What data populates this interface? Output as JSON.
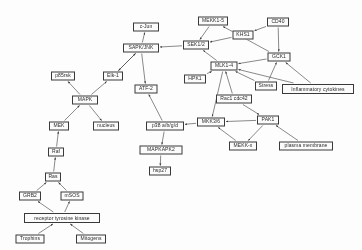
{
  "diagram": {
    "stroke_color": "#3a3a3a",
    "node_fill": "#fbfbfb",
    "background": "#fdfdfd",
    "nodes": [
      {
        "id": "c-jun",
        "label": "c-Jun",
        "x": 146,
        "y": 27,
        "w": 26,
        "h": 9
      },
      {
        "id": "mekk1-5",
        "label": "MEKK1-5",
        "x": 213,
        "y": 21,
        "w": 30,
        "h": 9
      },
      {
        "id": "cd40",
        "label": "CD40",
        "x": 278,
        "y": 22,
        "w": 22,
        "h": 9
      },
      {
        "id": "sapk-jnk",
        "label": "SAPK/JNK",
        "x": 141,
        "y": 48,
        "w": 36,
        "h": 9
      },
      {
        "id": "khs1",
        "label": "KHS1",
        "x": 243,
        "y": 35,
        "w": 21,
        "h": 9
      },
      {
        "id": "p85rsk",
        "label": "p85rsk",
        "x": 63,
        "y": 76,
        "w": 24,
        "h": 9
      },
      {
        "id": "elk-1",
        "label": "Elk-1",
        "x": 113,
        "y": 76,
        "w": 20,
        "h": 9
      },
      {
        "id": "sek1-2",
        "label": "SEK1/2",
        "x": 196,
        "y": 45,
        "w": 26,
        "h": 9
      },
      {
        "id": "gck1",
        "label": "GCK1",
        "x": 279,
        "y": 57,
        "w": 23,
        "h": 9
      },
      {
        "id": "mlk1-4",
        "label": "MLK1-4",
        "x": 224,
        "y": 66,
        "w": 27,
        "h": 9
      },
      {
        "id": "atf-2",
        "label": "ATF-2",
        "x": 146,
        "y": 89,
        "w": 23,
        "h": 9
      },
      {
        "id": "mapk",
        "label": "MAPK",
        "x": 85,
        "y": 100,
        "w": 26,
        "h": 9
      },
      {
        "id": "hpk1",
        "label": "HPK1",
        "x": 195,
        "y": 79,
        "w": 22,
        "h": 9
      },
      {
        "id": "stress",
        "label": "Stress",
        "x": 266,
        "y": 86,
        "w": 22,
        "h": 9
      },
      {
        "id": "infl-cyt",
        "label": "Inflammatory cytokines",
        "x": 318,
        "y": 89,
        "w": 72,
        "h": 10
      },
      {
        "id": "rac1-cdc42",
        "label": "Rac1 cdc42",
        "x": 234,
        "y": 99,
        "w": 36,
        "h": 9
      },
      {
        "id": "mek",
        "label": "MEK",
        "x": 59,
        "y": 126,
        "w": 20,
        "h": 9
      },
      {
        "id": "nucleus",
        "label": "nucleus",
        "x": 106,
        "y": 126,
        "w": 26,
        "h": 9
      },
      {
        "id": "p38",
        "label": "p38 a/b/g/d",
        "x": 165,
        "y": 126,
        "w": 38,
        "h": 9
      },
      {
        "id": "mkk3-6",
        "label": "MKK3/6",
        "x": 211,
        "y": 122,
        "w": 28,
        "h": 9
      },
      {
        "id": "pak1",
        "label": "PAK1",
        "x": 268,
        "y": 120,
        "w": 22,
        "h": 9
      },
      {
        "id": "mapkapk2",
        "label": "MAPKAPK2",
        "x": 161,
        "y": 150,
        "w": 43,
        "h": 9
      },
      {
        "id": "mekk-x",
        "label": "MEKK-x",
        "x": 243,
        "y": 146,
        "w": 28,
        "h": 9
      },
      {
        "id": "plasma-mem",
        "label": "plasma membrane",
        "x": 306,
        "y": 146,
        "w": 54,
        "h": 9
      },
      {
        "id": "raf",
        "label": "Raf",
        "x": 56,
        "y": 152,
        "w": 16,
        "h": 9
      },
      {
        "id": "ras",
        "label": "Ras",
        "x": 53,
        "y": 177,
        "w": 16,
        "h": 9
      },
      {
        "id": "hsp27",
        "label": "hsp27",
        "x": 160,
        "y": 171,
        "w": 22,
        "h": 9
      },
      {
        "id": "grb2",
        "label": "GRB2",
        "x": 30,
        "y": 196,
        "w": 22,
        "h": 9
      },
      {
        "id": "msos",
        "label": "mSOS",
        "x": 72,
        "y": 196,
        "w": 23,
        "h": 9
      },
      {
        "id": "rtk",
        "label": "receptor tyrosine kinase",
        "x": 62,
        "y": 218,
        "w": 76,
        "h": 10
      },
      {
        "id": "trophins",
        "label": "Trophins",
        "x": 30,
        "y": 239,
        "w": 29,
        "h": 9
      },
      {
        "id": "mitogens",
        "label": "Mitogens",
        "x": 91,
        "y": 239,
        "w": 30,
        "h": 9
      }
    ],
    "edges": [
      {
        "from": "sapk-jnk",
        "to": "c-jun"
      },
      {
        "from": "mekk1-5",
        "to": "sek1-2"
      },
      {
        "from": "cd40",
        "to": "khs1"
      },
      {
        "from": "cd40",
        "to": "gck1"
      },
      {
        "from": "khs1",
        "to": "sek1-2"
      },
      {
        "from": "sek1-2",
        "to": "sapk-jnk"
      },
      {
        "from": "sapk-jnk",
        "to": "elk-1"
      },
      {
        "from": "sapk-jnk",
        "to": "atf-2"
      },
      {
        "from": "elk-1",
        "to": "sapk-jnk"
      },
      {
        "from": "mapk",
        "to": "p85rsk"
      },
      {
        "from": "mapk",
        "to": "elk-1"
      },
      {
        "from": "mapk",
        "to": "nucleus"
      },
      {
        "from": "mek",
        "to": "mapk"
      },
      {
        "from": "gck1",
        "to": "mekk1-5"
      },
      {
        "from": "gck1",
        "to": "mlk1-4"
      },
      {
        "from": "mlk1-4",
        "to": "sek1-2"
      },
      {
        "from": "hpk1",
        "to": "mlk1-4"
      },
      {
        "from": "rac1-cdc42",
        "to": "mlk1-4"
      },
      {
        "from": "stress",
        "to": "gck1"
      },
      {
        "from": "infl-cyt",
        "to": "gck1"
      },
      {
        "from": "p38",
        "to": "atf-2"
      },
      {
        "from": "mkk3-6",
        "to": "p38"
      },
      {
        "from": "mlk1-4",
        "to": "mkk3-6"
      },
      {
        "from": "pak1",
        "to": "mkk3-6"
      },
      {
        "from": "rac1-cdc42",
        "to": "pak1"
      },
      {
        "from": "mekk-x",
        "to": "mkk3-6"
      },
      {
        "from": "pak1",
        "to": "mekk-x"
      },
      {
        "from": "plasma-mem",
        "to": "pak1"
      },
      {
        "from": "p38",
        "to": "mapkapk2"
      },
      {
        "from": "mapkapk2",
        "to": "hsp27"
      },
      {
        "from": "raf",
        "to": "mek"
      },
      {
        "from": "ras",
        "to": "raf"
      },
      {
        "from": "grb2",
        "to": "ras"
      },
      {
        "from": "msos",
        "to": "ras"
      },
      {
        "from": "rtk",
        "to": "grb2"
      },
      {
        "from": "rtk",
        "to": "msos"
      },
      {
        "from": "trophins",
        "to": "rtk"
      },
      {
        "from": "mitogens",
        "to": "rtk"
      },
      {
        "from": "stress",
        "to": "mlk1-4"
      },
      {
        "from": "infl-cyt",
        "to": "mlk1-4"
      }
    ]
  }
}
